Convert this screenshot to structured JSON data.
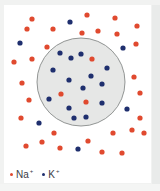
{
  "figure": {
    "type": "ion-distribution-diagram"
  },
  "colors": {
    "na": "#e04a2f",
    "k": "#1f2f6e",
    "cell_fill": "#e6e7e6",
    "cell_stroke": "#7a7d7c",
    "panel": "#ffffff"
  },
  "cell": {
    "cx": 81,
    "cy": 82,
    "r": 44
  },
  "ions": {
    "na_outside": [
      [
        32,
        19
      ],
      [
        87,
        15
      ],
      [
        115,
        18
      ],
      [
        137,
        26
      ],
      [
        27,
        29
      ],
      [
        53,
        29
      ],
      [
        82,
        33
      ],
      [
        98,
        31
      ],
      [
        117,
        34
      ],
      [
        136,
        44
      ],
      [
        47,
        47
      ],
      [
        14,
        62
      ],
      [
        32,
        59
      ],
      [
        22,
        83
      ],
      [
        134,
        77
      ],
      [
        140,
        93
      ],
      [
        29,
        100
      ],
      [
        21,
        118
      ],
      [
        140,
        118
      ],
      [
        54,
        133
      ],
      [
        88,
        141
      ],
      [
        113,
        133
      ],
      [
        132,
        130
      ],
      [
        144,
        133
      ],
      [
        26,
        146
      ],
      [
        42,
        142
      ],
      [
        60,
        148
      ],
      [
        102,
        152
      ],
      [
        122,
        153
      ]
    ],
    "k_outside": [
      [
        70,
        22
      ],
      [
        20,
        43
      ],
      [
        123,
        48
      ],
      [
        127,
        109
      ],
      [
        39,
        123
      ],
      [
        78,
        149
      ]
    ],
    "na_inside": [
      [
        92,
        59
      ],
      [
        61,
        94
      ],
      [
        86,
        102
      ]
    ],
    "k_inside": [
      [
        60,
        53
      ],
      [
        71,
        58
      ],
      [
        81,
        54
      ],
      [
        53,
        70
      ],
      [
        107,
        68
      ],
      [
        91,
        76
      ],
      [
        69,
        80
      ],
      [
        83,
        88
      ],
      [
        102,
        84
      ],
      [
        49,
        99
      ],
      [
        102,
        103
      ],
      [
        69,
        108
      ],
      [
        74,
        118
      ],
      [
        86,
        117
      ]
    ]
  },
  "legend": [
    {
      "label": "Na",
      "charge": "+",
      "color": "#e04a2f"
    },
    {
      "label": "K",
      "charge": "+",
      "color": "#1f2f6e"
    }
  ]
}
